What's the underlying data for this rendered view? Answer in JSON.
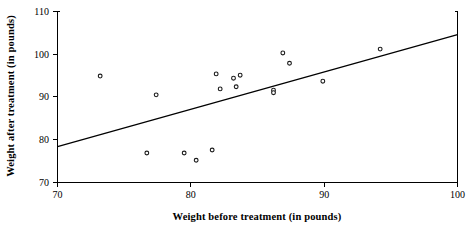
{
  "chart_data": {
    "type": "scatter",
    "title": "",
    "xlabel": "Weight before treatment (in pounds)",
    "ylabel": "Weight after treatment (in pounds)",
    "xlim": [
      70,
      100
    ],
    "ylim": [
      70,
      110
    ],
    "xticks": [
      70,
      80,
      90,
      100
    ],
    "yticks": [
      70,
      80,
      90,
      100,
      110
    ],
    "xtick_labels": [
      "70",
      "80",
      "90",
      "100"
    ],
    "ytick_labels": [
      "70",
      "80",
      "90",
      "100",
      "110"
    ],
    "grid": false,
    "legend": false,
    "legend_position": "none",
    "points": [
      {
        "x": 73.2,
        "y": 94.9
      },
      {
        "x": 76.7,
        "y": 76.9
      },
      {
        "x": 77.4,
        "y": 90.5
      },
      {
        "x": 79.5,
        "y": 76.9
      },
      {
        "x": 80.4,
        "y": 75.2
      },
      {
        "x": 81.6,
        "y": 77.6
      },
      {
        "x": 81.9,
        "y": 95.4
      },
      {
        "x": 82.2,
        "y": 91.9
      },
      {
        "x": 83.2,
        "y": 94.4
      },
      {
        "x": 83.4,
        "y": 92.4
      },
      {
        "x": 83.7,
        "y": 95.1
      },
      {
        "x": 86.2,
        "y": 91.6
      },
      {
        "x": 86.2,
        "y": 91.0
      },
      {
        "x": 86.9,
        "y": 100.3
      },
      {
        "x": 87.4,
        "y": 97.9
      },
      {
        "x": 89.9,
        "y": 93.7
      },
      {
        "x": 94.2,
        "y": 101.2
      }
    ],
    "trendline": {
      "label": "regression line",
      "x_start": 70,
      "y_start": 78.4,
      "x_end": 100,
      "y_end": 104.6
    }
  }
}
